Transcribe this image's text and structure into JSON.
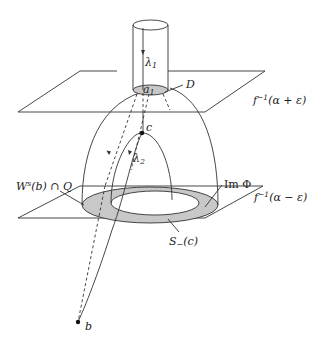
{
  "figure": {
    "labels": {
      "lambda1": "λ",
      "lambda1_sub": "1",
      "a1": "a",
      "a1_sub": "1",
      "D": "D",
      "upper_plane_f": "f",
      "upper_plane_sup": "−1",
      "upper_plane_arg": "(α + ε)",
      "c": "c",
      "lambda2": "λ",
      "lambda2_sub": "2",
      "ws_b_q": "W",
      "ws_sup": "s",
      "ws_rest": "(b) ∩ Q",
      "im_phi": "Im Φ",
      "lower_plane_f": "f",
      "lower_plane_sup": "−1",
      "lower_plane_arg": "(α − ε)",
      "s_minus": "S",
      "s_minus_sub": "−",
      "s_minus_arg": "(c)",
      "b": "b"
    },
    "colors": {
      "stroke": "#333333",
      "shade": "#c8c8c8",
      "background": "#ffffff"
    }
  }
}
